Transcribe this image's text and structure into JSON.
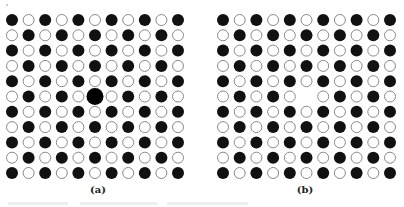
{
  "figure": {
    "panels": [
      {
        "id": "a",
        "label": "(a)",
        "rows": 11,
        "cols": 11,
        "pattern": "checkerboard, filled at even (row+col)",
        "origin_x": 12,
        "origin_y": 20,
        "pitch_x": 16.6,
        "pitch_y": 15.3,
        "atom_radius": 6,
        "defect": {
          "type": "large-substitutional-atom",
          "row": 5,
          "col": 5,
          "radius": 8.5,
          "fill": "#000000"
        },
        "label_x": 98
      },
      {
        "id": "b",
        "label": "(b)",
        "rows": 11,
        "cols": 11,
        "pattern": "checkerboard, filled at even (row+col)",
        "origin_x": 12,
        "origin_y": 20,
        "pitch_x": 16.7,
        "pitch_y": 15.3,
        "atom_radius": 6,
        "defect": {
          "type": "vacancy",
          "row": 5,
          "col": 5
        },
        "label_x": 94
      }
    ],
    "colors": {
      "filled_atom": "#111111",
      "hollow_atom_stroke": "#8a8a8a",
      "background": "#ffffff"
    }
  }
}
